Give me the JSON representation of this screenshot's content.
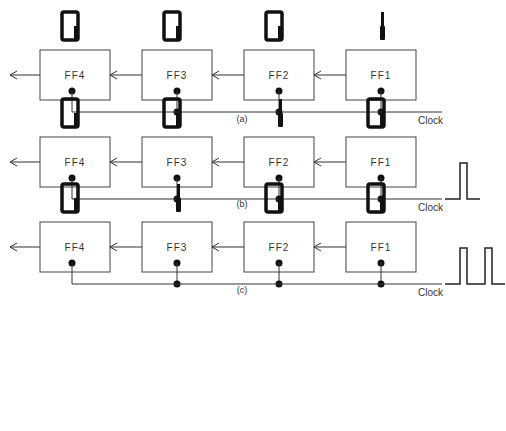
{
  "clock_label": "Clock",
  "panels": [
    {
      "caption": "(a)",
      "clock_pulses": 0,
      "stages": [
        {
          "label": "FF4",
          "digit": "0"
        },
        {
          "label": "FF3",
          "digit": "0"
        },
        {
          "label": "FF2",
          "digit": "0"
        },
        {
          "label": "FF1",
          "digit": "1"
        }
      ]
    },
    {
      "caption": "(b)",
      "clock_pulses": 1,
      "stages": [
        {
          "label": "FF4",
          "digit": "0"
        },
        {
          "label": "FF3",
          "digit": "0"
        },
        {
          "label": "FF2",
          "digit": "1"
        },
        {
          "label": "FF1",
          "digit": "0"
        }
      ]
    },
    {
      "caption": "(c)",
      "clock_pulses": 2,
      "stages": [
        {
          "label": "FF4",
          "digit": "0"
        },
        {
          "label": "FF3",
          "digit": "1"
        },
        {
          "label": "FF2",
          "digit": "0"
        },
        {
          "label": "FF1",
          "digit": "0"
        }
      ]
    }
  ]
}
